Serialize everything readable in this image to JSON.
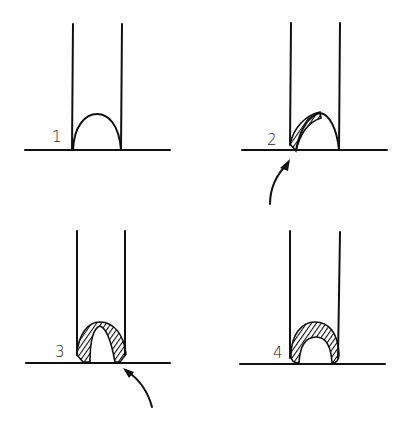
{
  "diagram": {
    "panels": [
      {
        "label": "1",
        "state": "bare arch between two vertical walls",
        "arrow": false
      },
      {
        "label": "2",
        "state": "hatched bead applied to left side of arch",
        "arrow": true,
        "arrow_side": "left"
      },
      {
        "label": "3",
        "state": "hatched bead on both sides, right joint added",
        "arrow": true,
        "arrow_side": "right"
      },
      {
        "label": "4",
        "state": "completed full hatched bead over arch",
        "arrow": false
      }
    ],
    "colors": {
      "ink": "#111111",
      "background": "#ffffff"
    }
  }
}
